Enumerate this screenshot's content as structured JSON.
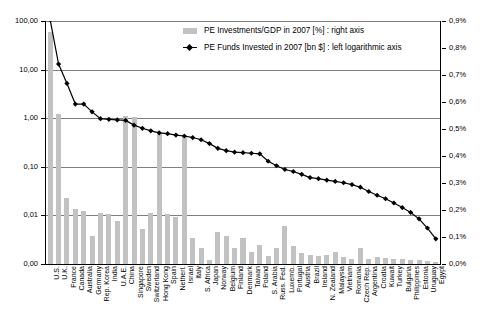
{
  "legend": {
    "position": "inside-top-center",
    "entries": [
      {
        "id": "bars",
        "label": "PE Investments/GDP in 2007 [%] : right axis",
        "marker": "bar-swatch-icon",
        "color": "#c2c2c2"
      },
      {
        "id": "line",
        "label": "PE Funds Invested in 2007 [bn $] : left logarithmic axis",
        "marker": "line-diamond-icon",
        "color": "#000000"
      }
    ]
  },
  "axes": {
    "left": {
      "label": "PE Funds Invested in 2007 [bn $]",
      "scale": "log",
      "ticks": [
        "100,00",
        "10,00",
        "1,00",
        "0,10",
        "0,01",
        "0,00"
      ],
      "tick_values": [
        100,
        10,
        1,
        0.1,
        0.01,
        0.001
      ]
    },
    "right": {
      "label": "PE Investments/GDP in 2007 [%]",
      "scale": "linear",
      "ticks": [
        "0,9%",
        "0,8%",
        "0,7%",
        "0,6%",
        "0,5%",
        "0,4%",
        "0,3%",
        "0,2%",
        "0,1%",
        "0,0%"
      ],
      "tick_values": [
        0.9,
        0.8,
        0.7,
        0.6,
        0.5,
        0.4,
        0.3,
        0.2,
        0.1,
        0.0
      ]
    }
  },
  "chart_data": {
    "type": "bar",
    "title": "",
    "subtitle": "",
    "xlabel": "",
    "ylabel": "PE Funds Invested in 2007 [bn $]",
    "y2label": "PE Investments/GDP in 2007 [%]",
    "grid": true,
    "yscale": "log",
    "ylim": [
      0.001,
      100
    ],
    "y2lim": [
      0.0,
      0.9
    ],
    "categories": [
      "U.S.",
      "U.K.",
      "France",
      "Canada",
      "Australia",
      "Germany",
      "Rep. Korea",
      "India",
      "U.A.E.",
      "China",
      "Singapore",
      "Sweden",
      "Switzerland",
      "Hong Kong",
      "Spain",
      "Netherl.",
      "Israel",
      "Italy",
      "S. Africa",
      "Japan",
      "Norway",
      "Belgium",
      "Finland",
      "Denmark",
      "Taiwan",
      "Poland",
      "S. Arabia",
      "Russ. Fed.",
      "Luxemb.",
      "Portugal",
      "Austria",
      "Brazil",
      "Ireland",
      "N. Zealand",
      "Malaysia",
      "Vietnam",
      "Romania",
      "Czech Rep.",
      "Argentina",
      "Croatia",
      "Kuwait",
      "Turkey",
      "Bulgaria",
      "Philippines",
      "Estonia",
      "Uruguay",
      "Egypt"
    ],
    "series": [
      {
        "name": "PE Funds Invested in 2007 [bn $]",
        "type": "line",
        "axis": "left",
        "marker": "diamond",
        "color": "#000000",
        "values": [
          105.0,
          13.0,
          5.2,
          1.95,
          1.95,
          1.35,
          0.98,
          0.95,
          0.92,
          0.9,
          0.72,
          0.62,
          0.55,
          0.5,
          0.48,
          0.45,
          0.43,
          0.4,
          0.36,
          0.3,
          0.24,
          0.215,
          0.2,
          0.195,
          0.19,
          0.185,
          0.13,
          0.105,
          0.088,
          0.08,
          0.07,
          0.06,
          0.057,
          0.053,
          0.05,
          0.047,
          0.043,
          0.038,
          0.031,
          0.026,
          0.022,
          0.018,
          0.0145,
          0.0115,
          0.0085,
          0.0055,
          0.0033
        ]
      },
      {
        "name": "PE Investments/GDP in 2007 [%]",
        "type": "bar",
        "axis": "right",
        "color": "#c2c2c2",
        "values": [
          0.86,
          0.555,
          0.245,
          0.205,
          0.195,
          0.105,
          0.19,
          0.185,
          0.16,
          0.55,
          0.545,
          0.13,
          0.19,
          0.48,
          0.185,
          0.175,
          0.47,
          0.095,
          0.06,
          0.015,
          0.12,
          0.105,
          0.06,
          0.095,
          0.045,
          0.07,
          0.03,
          0.06,
          0.14,
          0.065,
          0.04,
          0.035,
          0.03,
          0.035,
          0.045,
          0.025,
          0.02,
          0.06,
          0.018,
          0.025,
          0.022,
          0.02,
          0.018,
          0.016,
          0.014,
          0.01,
          0.008
        ]
      }
    ]
  }
}
